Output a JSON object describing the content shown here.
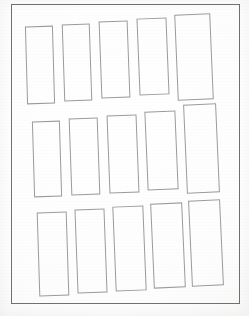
{
  "document": {
    "title": "Blank label template sheet",
    "description": "Scanned white sheet with a printed outer border containing a 3 row by 5 column grid of tall blank rectangular cells",
    "background_color": "#fdfdfd",
    "border_color": "#6f7173",
    "cell_border_color": "#9a9b9d",
    "page_border": {
      "left": 11,
      "top": 4,
      "width": 229,
      "height": 300
    },
    "grid": {
      "rows": 3,
      "columns": 5,
      "total_cells": 15
    },
    "cells": [
      {
        "id": "cell-r1c1",
        "row": 1,
        "column": 1,
        "label": "",
        "left": 26,
        "top": 26,
        "width": 28,
        "height": 78,
        "rotation": -1.6
      },
      {
        "id": "cell-r1c2",
        "row": 1,
        "column": 2,
        "label": "",
        "left": 63,
        "top": 24,
        "width": 28,
        "height": 77,
        "rotation": -1.9
      },
      {
        "id": "cell-r1c3",
        "row": 1,
        "column": 3,
        "label": "",
        "left": 100,
        "top": 21,
        "width": 29,
        "height": 77,
        "rotation": -2.1
      },
      {
        "id": "cell-r1c4",
        "row": 1,
        "column": 4,
        "label": "",
        "left": 138,
        "top": 18,
        "width": 30,
        "height": 77,
        "rotation": -2.3
      },
      {
        "id": "cell-r1c5",
        "row": 1,
        "column": 5,
        "label": "",
        "left": 176,
        "top": 14,
        "width": 36,
        "height": 86,
        "rotation": -2.4
      },
      {
        "id": "cell-r2c1",
        "row": 2,
        "column": 1,
        "label": "",
        "left": 33,
        "top": 121,
        "width": 28,
        "height": 76,
        "rotation": -1.7
      },
      {
        "id": "cell-r2c2",
        "row": 2,
        "column": 2,
        "label": "",
        "left": 70,
        "top": 118,
        "width": 29,
        "height": 77,
        "rotation": -2.0
      },
      {
        "id": "cell-r2c3",
        "row": 2,
        "column": 3,
        "label": "",
        "left": 108,
        "top": 115,
        "width": 30,
        "height": 78,
        "rotation": -2.2
      },
      {
        "id": "cell-r2c4",
        "row": 2,
        "column": 4,
        "label": "",
        "left": 146,
        "top": 111,
        "width": 31,
        "height": 79,
        "rotation": -2.4
      },
      {
        "id": "cell-r2c5",
        "row": 2,
        "column": 5,
        "label": "",
        "left": 185,
        "top": 104,
        "width": 33,
        "height": 89,
        "rotation": -2.5
      },
      {
        "id": "cell-r3c1",
        "row": 3,
        "column": 1,
        "label": "",
        "left": 38,
        "top": 212,
        "width": 30,
        "height": 84,
        "rotation": -1.8
      },
      {
        "id": "cell-r3c2",
        "row": 3,
        "column": 2,
        "label": "",
        "left": 76,
        "top": 209,
        "width": 30,
        "height": 84,
        "rotation": -2.1
      },
      {
        "id": "cell-r3c3",
        "row": 3,
        "column": 3,
        "label": "",
        "left": 114,
        "top": 206,
        "width": 31,
        "height": 85,
        "rotation": -2.3
      },
      {
        "id": "cell-r3c4",
        "row": 3,
        "column": 4,
        "label": "",
        "left": 152,
        "top": 203,
        "width": 32,
        "height": 85,
        "rotation": -2.5
      },
      {
        "id": "cell-r3c5",
        "row": 3,
        "column": 5,
        "label": "",
        "left": 190,
        "top": 200,
        "width": 32,
        "height": 86,
        "rotation": -2.6
      }
    ]
  }
}
